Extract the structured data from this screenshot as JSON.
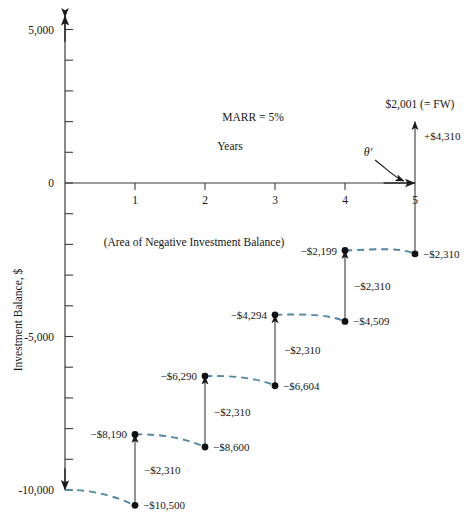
{
  "figure": {
    "y_axis_title": "Investment Balance, $",
    "x_axis_title": "Years",
    "marr_note": "MARR = 5%",
    "area_note": "(Area of Negative Investment Balance)",
    "fw_label": "$2,001 (= FW)",
    "fw_arrow_label": "+$4,310",
    "theta_label": "θ′",
    "dash_color": "#4f87a8",
    "axis_color": "#3b3b3b",
    "text_color": "#161616"
  },
  "chart_data": {
    "type": "line",
    "xlabel": "Years",
    "ylabel": "Investment Balance, $",
    "xlim": [
      0,
      5
    ],
    "ylim": [
      -11000,
      5500
    ],
    "xticks": [
      "1",
      "2",
      "3",
      "4",
      "5"
    ],
    "xtick_values": [
      1,
      2,
      3,
      4,
      5
    ],
    "yticks": [
      "5,000",
      "0",
      "-5,000",
      "-10,000"
    ],
    "ytick_values": [
      5000,
      0,
      -5000,
      -10000
    ],
    "ytick_minor_values": [
      4000,
      3000,
      2000,
      1000,
      -1000,
      -2000,
      -3000,
      -4000,
      -6000,
      -7000,
      -8000,
      -9000
    ],
    "grid": false,
    "legend": null,
    "interest_rate_percent": 5,
    "balance_points": [
      {
        "year": 0,
        "value": -10000,
        "label": "-10,000",
        "label_side": "axis"
      },
      {
        "year": 1,
        "value": -10500,
        "label": "−$10,500",
        "label_side": "right"
      },
      {
        "year": 1,
        "value": -8190,
        "label": "−$8,190",
        "label_side": "left"
      },
      {
        "year": 2,
        "value": -8600,
        "label": "−$8,600",
        "label_side": "right"
      },
      {
        "year": 2,
        "value": -6290,
        "label": "−$6,290",
        "label_side": "left"
      },
      {
        "year": 3,
        "value": -6604,
        "label": "−$6,604",
        "label_side": "right"
      },
      {
        "year": 3,
        "value": -4294,
        "label": "−$4,294",
        "label_side": "left"
      },
      {
        "year": 4,
        "value": -4509,
        "label": "−$4,509",
        "label_side": "right"
      },
      {
        "year": 4,
        "value": -2199,
        "label": "−$2,199",
        "label_side": "left"
      },
      {
        "year": 5,
        "value": -2310,
        "label": "−$2,310",
        "label_side": "right"
      },
      {
        "year": 5,
        "value": 2001,
        "label": "$2,001 (= FW)",
        "label_side": "top"
      }
    ],
    "interest_growth_segments": [
      {
        "from_year": 0,
        "from_value": -10000,
        "to_year": 1,
        "to_value": -10500
      },
      {
        "from_year": 1,
        "from_value": -8190,
        "to_year": 2,
        "to_value": -8600
      },
      {
        "from_year": 2,
        "from_value": -6290,
        "to_year": 3,
        "to_value": -6604
      },
      {
        "from_year": 3,
        "from_value": -4294,
        "to_year": 4,
        "to_value": -4509
      },
      {
        "from_year": 4,
        "from_value": -2199,
        "to_year": 5,
        "to_value": -2310
      }
    ],
    "payment_arrows": [
      {
        "year": 1,
        "from_value": -10500,
        "to_value": -8190,
        "label": "−$2,310"
      },
      {
        "year": 2,
        "from_value": -8600,
        "to_value": -6290,
        "label": "−$2,310"
      },
      {
        "year": 3,
        "from_value": -6604,
        "to_value": -4294,
        "label": "−$2,310"
      },
      {
        "year": 4,
        "from_value": -4509,
        "to_value": -2199,
        "label": "−$2,310"
      },
      {
        "year": 5,
        "from_value": -2310,
        "to_value": 2001,
        "label": "+$4,310"
      }
    ]
  }
}
